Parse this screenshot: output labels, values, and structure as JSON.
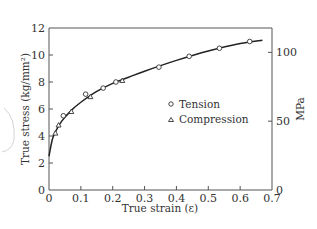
{
  "chart_data": {
    "type": "scatter",
    "title": "",
    "xlabel": "True strain (ε)",
    "ylabel": "True stress (kg/mm²)",
    "y2label": "MPa",
    "xlim": [
      0,
      0.7
    ],
    "ylim": [
      0,
      12
    ],
    "y2lim": [
      0,
      117.7
    ],
    "x_ticks": [
      0,
      0.1,
      0.2,
      0.3,
      0.4,
      0.5,
      0.6,
      0.7
    ],
    "x_tick_labels": [
      "0",
      "0.1",
      "0.2",
      "0.3",
      "0.4",
      "0.5",
      "0.6",
      "0.7"
    ],
    "y_ticks": [
      0,
      2,
      4,
      6,
      8,
      10,
      12
    ],
    "y_tick_labels": [
      "0",
      "2",
      "4",
      "6",
      "8",
      "10",
      "12"
    ],
    "y2_ticks": [
      0,
      50,
      100
    ],
    "y2_tick_labels": [
      "0",
      "50",
      "100"
    ],
    "grid": false,
    "legend": {
      "position": "center-right",
      "entries": [
        "Tension",
        "Compression"
      ]
    },
    "series": [
      {
        "name": "Tension",
        "marker": "circle",
        "x": [
          0.045,
          0.115,
          0.17,
          0.21,
          0.345,
          0.44,
          0.535,
          0.63
        ],
        "y": [
          5.5,
          7.1,
          7.55,
          8.0,
          9.1,
          9.9,
          10.5,
          11.0
        ]
      },
      {
        "name": "Compression",
        "marker": "triangle",
        "x": [
          0.02,
          0.03,
          0.07,
          0.13,
          0.23
        ],
        "y": [
          4.2,
          4.8,
          5.8,
          6.9,
          8.1
        ]
      },
      {
        "name": "Fitted curve",
        "marker": "line",
        "x": [
          0,
          0.01,
          0.02,
          0.04,
          0.07,
          0.1,
          0.15,
          0.2,
          0.25,
          0.3,
          0.4,
          0.5,
          0.6,
          0.67
        ],
        "y": [
          2.5,
          3.7,
          4.3,
          5.1,
          5.9,
          6.5,
          7.3,
          7.9,
          8.35,
          8.8,
          9.6,
          10.3,
          10.85,
          11.1
        ]
      }
    ]
  }
}
